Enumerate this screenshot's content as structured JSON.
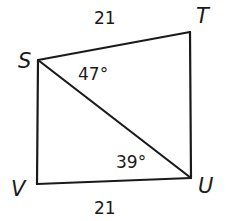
{
  "diagram": {
    "type": "quadrilateral-with-diagonal",
    "vertices": [
      {
        "name": "S",
        "x": 38,
        "y": 60,
        "label_x": 18,
        "label_y": 68
      },
      {
        "name": "T",
        "x": 190,
        "y": 32,
        "label_x": 197,
        "label_y": 22
      },
      {
        "name": "U",
        "x": 191,
        "y": 178,
        "label_x": 199,
        "label_y": 193
      },
      {
        "name": "V",
        "x": 37,
        "y": 184,
        "label_x": 11,
        "label_y": 195
      }
    ],
    "segments": [
      {
        "from": "S",
        "to": "T"
      },
      {
        "from": "T",
        "to": "U"
      },
      {
        "from": "U",
        "to": "V"
      },
      {
        "from": "V",
        "to": "S"
      },
      {
        "from": "S",
        "to": "U",
        "diagonal": true
      }
    ],
    "side_labels": [
      {
        "segment": "ST",
        "text": "21",
        "x": 94,
        "y": 24
      },
      {
        "segment": "VU",
        "text": "21",
        "x": 94,
        "y": 214
      }
    ],
    "angle_labels": [
      {
        "vertex": "S",
        "angle": "TSU",
        "text": "47°",
        "x": 78,
        "y": 80
      },
      {
        "vertex": "U",
        "angle": "SUV",
        "text": "39°",
        "x": 116,
        "y": 168
      }
    ],
    "line_color": "#1a1a1a"
  }
}
